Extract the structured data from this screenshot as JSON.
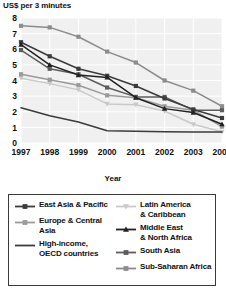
{
  "chart_data": {
    "type": "line",
    "title": "",
    "ylabel": "US$ per 3 minutes",
    "xlabel": "Year",
    "x": [
      1997,
      1998,
      1999,
      2000,
      2001,
      2002,
      2003,
      2004
    ],
    "xticklabels": [
      "1997",
      "1998",
      "1999",
      "2000",
      "2001",
      "2002",
      "2003",
      "2004"
    ],
    "yticklabels": [
      "0",
      "1",
      "2",
      "3",
      "4",
      "5",
      "6",
      "7",
      "8"
    ],
    "ylim": [
      0,
      8
    ],
    "ytick_step": 1,
    "grid": "both-light",
    "legend_position": "below-plot-boxed",
    "series": [
      {
        "name": "East Asia & Pacific",
        "color": "#3b3b3b",
        "marker": "square",
        "values": [
          6.45,
          5.55,
          4.75,
          4.3,
          3.65,
          2.85,
          2.15,
          1.6
        ]
      },
      {
        "name": "Europe & Central Asia",
        "color": "#9a9a9a",
        "marker": "square",
        "values": [
          4.4,
          4.05,
          3.7,
          3.05,
          2.9,
          2.35,
          2.1,
          1.05
        ]
      },
      {
        "name": "High-income, OECD countries",
        "color": "#3b3b3b",
        "marker": "none",
        "values": [
          2.25,
          1.75,
          1.35,
          0.78,
          0.75,
          0.72,
          0.7,
          0.7
        ]
      },
      {
        "name": "Latin America & Caribbean",
        "color": "#c9c9c9",
        "marker": "triangle-down",
        "values": [
          4.15,
          3.8,
          3.4,
          2.5,
          2.45,
          2.05,
          1.2,
          0.72
        ]
      },
      {
        "name": "Middle East & North Africa",
        "color": "#222222",
        "marker": "triangle-up",
        "values": [
          6.3,
          5.0,
          4.35,
          4.2,
          2.9,
          2.2,
          1.95,
          1.2
        ]
      },
      {
        "name": "South Asia",
        "color": "#5d5d5d",
        "marker": "square",
        "values": [
          5.95,
          4.75,
          4.4,
          3.55,
          2.95,
          2.95,
          2.1,
          2.1
        ]
      },
      {
        "name": "Sub-Saharan Africa",
        "color": "#8c8c8c",
        "marker": "square",
        "values": [
          7.5,
          7.4,
          6.8,
          5.85,
          5.15,
          4.0,
          3.35,
          2.35
        ]
      }
    ]
  },
  "legend": {
    "left_items": [
      {
        "label": "East Asia & Pacific",
        "color": "#3b3b3b",
        "marker": "square"
      },
      {
        "label": "Europe & Central\nAsia",
        "color": "#9a9a9a",
        "marker": "square"
      },
      {
        "label": "High-income,\nOECD countries",
        "color": "#3b3b3b",
        "marker": "none"
      }
    ],
    "right_items": [
      {
        "label": "Latin America\n& Caribbean",
        "color": "#c9c9c9",
        "marker": "triangle-down"
      },
      {
        "label": "Middle East\n& North Africa",
        "color": "#222222",
        "marker": "triangle-up"
      },
      {
        "label": "South Asia",
        "color": "#5d5d5d",
        "marker": "square"
      },
      {
        "label": "Sub-Saharan Africa",
        "color": "#8c8c8c",
        "marker": "square"
      }
    ]
  }
}
